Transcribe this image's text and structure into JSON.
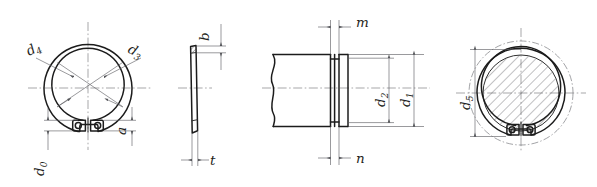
{
  "drawing": {
    "title": "Retaining ring (external circlip) dimensioned engineering drawing",
    "background_color": "#ffffff",
    "line_color": "#1c1c1c",
    "dimension_line_color": "#55565a",
    "center_line_color": "#6b6c70",
    "views": [
      {
        "id": "view-front-ring",
        "name": "front-view-retaining-ring",
        "labels": [
          {
            "id": "d4",
            "symbol": "d",
            "subscript": "4",
            "text": "d4"
          },
          {
            "id": "d3",
            "symbol": "d",
            "subscript": "3",
            "text": "d3"
          },
          {
            "id": "d0",
            "symbol": "d",
            "subscript": "0",
            "text": "d0"
          },
          {
            "id": "a",
            "symbol": "a",
            "subscript": "",
            "text": "a"
          }
        ]
      },
      {
        "id": "view-side-ring",
        "name": "side-view-retaining-ring",
        "labels": [
          {
            "id": "b",
            "symbol": "b",
            "subscript": "",
            "text": "b"
          },
          {
            "id": "t",
            "symbol": "t",
            "subscript": "",
            "text": "t"
          }
        ]
      },
      {
        "id": "view-shaft-groove",
        "name": "shaft-groove-section-view",
        "labels": [
          {
            "id": "m",
            "symbol": "m",
            "subscript": "",
            "text": "m"
          },
          {
            "id": "n",
            "symbol": "n",
            "subscript": "",
            "text": "n"
          },
          {
            "id": "d2",
            "symbol": "d",
            "subscript": "2",
            "text": "d2"
          },
          {
            "id": "d1",
            "symbol": "d",
            "subscript": "1",
            "text": "d1"
          }
        ]
      },
      {
        "id": "view-assembly",
        "name": "assembly-end-view-ring-on-shaft",
        "labels": [
          {
            "id": "d5",
            "symbol": "d",
            "subscript": "5",
            "text": "d5"
          }
        ]
      }
    ],
    "label_text": {
      "d4": {
        "base": "d",
        "sub": "4"
      },
      "d3": {
        "base": "d",
        "sub": "3"
      },
      "d0": {
        "base": "d",
        "sub": "0"
      },
      "a": {
        "base": "a",
        "sub": ""
      },
      "b": {
        "base": "b",
        "sub": ""
      },
      "t": {
        "base": "t",
        "sub": ""
      },
      "m": {
        "base": "m",
        "sub": ""
      },
      "n": {
        "base": "n",
        "sub": ""
      },
      "d2": {
        "base": "d",
        "sub": "2"
      },
      "d1": {
        "base": "d",
        "sub": "1"
      },
      "d5": {
        "base": "d",
        "sub": "5"
      }
    }
  }
}
